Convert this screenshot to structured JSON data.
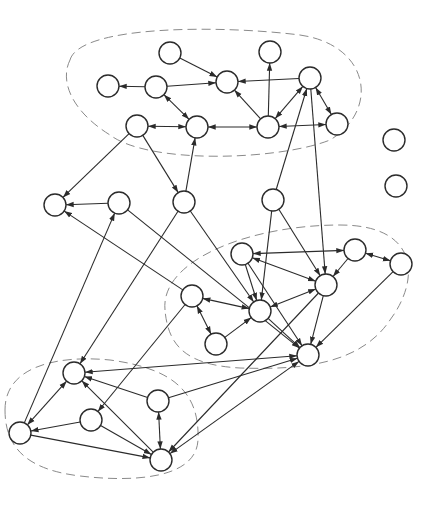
{
  "diagram": {
    "type": "directed-graph",
    "node_radius": 11,
    "colors": {
      "background": "#ffffff",
      "stroke": "#2b2b2b",
      "cluster_outline": "#8a8a8a"
    },
    "clusters": [
      {
        "id": "top",
        "path": "M 70 60 C 80 25, 220 25, 300 35 C 370 45, 380 110, 330 140 C 280 160, 150 165, 110 135 C 70 110, 60 80, 70 60 Z"
      },
      {
        "id": "right",
        "path": "M 165 310 C 160 260, 250 225, 340 225 C 420 225, 420 280, 390 320 C 360 365, 300 370, 240 368 C 185 365, 168 345, 165 310 Z"
      },
      {
        "id": "bottom-left",
        "path": "M 5 410 C 5 365, 60 355, 110 360 C 170 368, 200 390, 198 440 C 196 480, 130 482, 80 476 C 30 470, 5 450, 5 410 Z"
      }
    ],
    "nodes": [
      {
        "id": "A",
        "x": 170,
        "y": 53
      },
      {
        "id": "B",
        "x": 270,
        "y": 52
      },
      {
        "id": "C",
        "x": 108,
        "y": 86
      },
      {
        "id": "D",
        "x": 156,
        "y": 87
      },
      {
        "id": "E",
        "x": 227,
        "y": 82
      },
      {
        "id": "F",
        "x": 310,
        "y": 78
      },
      {
        "id": "G",
        "x": 137,
        "y": 126
      },
      {
        "id": "H",
        "x": 197,
        "y": 127
      },
      {
        "id": "I",
        "x": 268,
        "y": 127
      },
      {
        "id": "J",
        "x": 337,
        "y": 124
      },
      {
        "id": "K",
        "x": 55,
        "y": 205
      },
      {
        "id": "L",
        "x": 119,
        "y": 203
      },
      {
        "id": "M",
        "x": 184,
        "y": 202
      },
      {
        "id": "N",
        "x": 192,
        "y": 296
      },
      {
        "id": "O",
        "x": 273,
        "y": 200
      },
      {
        "id": "P",
        "x": 242,
        "y": 254
      },
      {
        "id": "Q",
        "x": 355,
        "y": 250
      },
      {
        "id": "R",
        "x": 401,
        "y": 264
      },
      {
        "id": "S",
        "x": 326,
        "y": 285
      },
      {
        "id": "T",
        "x": 260,
        "y": 311
      },
      {
        "id": "U",
        "x": 216,
        "y": 344
      },
      {
        "id": "V",
        "x": 308,
        "y": 355
      },
      {
        "id": "W",
        "x": 74,
        "y": 373
      },
      {
        "id": "X",
        "x": 158,
        "y": 401
      },
      {
        "id": "Y",
        "x": 91,
        "y": 420
      },
      {
        "id": "Z",
        "x": 20,
        "y": 433
      },
      {
        "id": "AA",
        "x": 161,
        "y": 460
      },
      {
        "id": "ISO1",
        "x": 394,
        "y": 140
      },
      {
        "id": "ISO2",
        "x": 396,
        "y": 186
      }
    ],
    "edges": [
      {
        "from": "A",
        "to": "E",
        "both": false
      },
      {
        "from": "D",
        "to": "C",
        "both": false
      },
      {
        "from": "D",
        "to": "E",
        "both": false
      },
      {
        "from": "D",
        "to": "H",
        "both": true
      },
      {
        "from": "G",
        "to": "H",
        "both": true
      },
      {
        "from": "F",
        "to": "E",
        "both": false
      },
      {
        "from": "I",
        "to": "B",
        "both": false
      },
      {
        "from": "I",
        "to": "E",
        "both": false
      },
      {
        "from": "I",
        "to": "F",
        "both": true
      },
      {
        "from": "H",
        "to": "I",
        "both": true
      },
      {
        "from": "I",
        "to": "J",
        "both": true
      },
      {
        "from": "F",
        "to": "J",
        "both": true
      },
      {
        "from": "O",
        "to": "F",
        "both": false
      },
      {
        "from": "F",
        "to": "S",
        "both": false
      },
      {
        "from": "G",
        "to": "K",
        "both": false
      },
      {
        "from": "G",
        "to": "M",
        "both": false
      },
      {
        "from": "M",
        "to": "H",
        "both": false
      },
      {
        "from": "L",
        "to": "K",
        "both": false
      },
      {
        "from": "L",
        "to": "V",
        "both": false
      },
      {
        "from": "M",
        "to": "T",
        "both": false
      },
      {
        "from": "M",
        "to": "W",
        "both": false
      },
      {
        "from": "N",
        "to": "K",
        "both": false
      },
      {
        "from": "O",
        "to": "T",
        "both": false
      },
      {
        "from": "O",
        "to": "S",
        "both": false
      },
      {
        "from": "P",
        "to": "T",
        "both": false
      },
      {
        "from": "P",
        "to": "S",
        "both": true
      },
      {
        "from": "P",
        "to": "Q",
        "both": true
      },
      {
        "from": "Q",
        "to": "R",
        "both": true
      },
      {
        "from": "Q",
        "to": "S",
        "both": false
      },
      {
        "from": "N",
        "to": "T",
        "both": true
      },
      {
        "from": "S",
        "to": "T",
        "both": true
      },
      {
        "from": "N",
        "to": "U",
        "both": true
      },
      {
        "from": "U",
        "to": "T",
        "both": false
      },
      {
        "from": "T",
        "to": "V",
        "both": false
      },
      {
        "from": "S",
        "to": "V",
        "both": false
      },
      {
        "from": "R",
        "to": "V",
        "both": false
      },
      {
        "from": "P",
        "to": "V",
        "both": false
      },
      {
        "from": "S",
        "to": "AA",
        "both": false
      },
      {
        "from": "Z",
        "to": "L",
        "both": false
      },
      {
        "from": "N",
        "to": "Y",
        "both": false
      },
      {
        "from": "V",
        "to": "W",
        "both": true
      },
      {
        "from": "X",
        "to": "V",
        "both": false
      },
      {
        "from": "AA",
        "to": "V",
        "both": true
      },
      {
        "from": "X",
        "to": "W",
        "both": false
      },
      {
        "from": "AA",
        "to": "W",
        "both": false
      },
      {
        "from": "X",
        "to": "AA",
        "both": true
      },
      {
        "from": "Z",
        "to": "W",
        "both": true
      },
      {
        "from": "Y",
        "to": "Z",
        "both": false
      },
      {
        "from": "Z",
        "to": "AA",
        "both": false
      },
      {
        "from": "Y",
        "to": "AA",
        "both": false
      }
    ]
  }
}
